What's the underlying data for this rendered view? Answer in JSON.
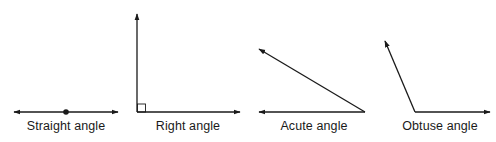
{
  "diagram": {
    "type": "angle-types",
    "stroke_color": "#1a1a1a",
    "background": "#ffffff",
    "figures": [
      {
        "id": "straight",
        "label": "Straight angle",
        "label_x": 66,
        "description": "Two opposite rays forming a line, vertex marked with a dot",
        "vertex": [
          66,
          112
        ],
        "rays": [
          [
            14,
            112
          ],
          [
            118,
            112
          ]
        ],
        "vertex_marker": "dot"
      },
      {
        "id": "right",
        "label": "Right angle",
        "label_x": 188,
        "description": "Vertical and horizontal rays meeting at 90 degrees with square marker",
        "vertex": [
          137,
          112
        ],
        "rays": [
          [
            137,
            14
          ],
          [
            240,
            112
          ]
        ],
        "vertex_marker": "square"
      },
      {
        "id": "acute",
        "label": "Acute angle",
        "label_x": 314,
        "description": "Two rays from right-side vertex, angle less than 90 degrees",
        "vertex": [
          365,
          112
        ],
        "rays": [
          [
            259,
            112
          ],
          [
            259,
            48
          ]
        ],
        "vertex_marker": "none"
      },
      {
        "id": "obtuse",
        "label": "Obtuse angle",
        "label_x": 440,
        "description": "Two rays from vertex, angle greater than 90 degrees",
        "vertex": [
          415,
          112
        ],
        "rays": [
          [
            490,
            112
          ],
          [
            384,
            40
          ]
        ],
        "vertex_marker": "none"
      }
    ]
  }
}
